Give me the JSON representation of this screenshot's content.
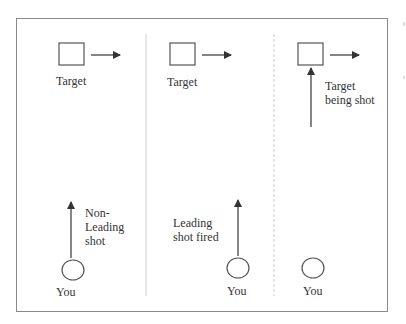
{
  "diagram": {
    "colors": {
      "stroke": "#555555",
      "border": "#8a8a8a",
      "divider": "#cfcfcf",
      "text": "#333333"
    },
    "panels": [
      {
        "id": "panel-1",
        "target_label": "Target",
        "shot_label": "Non-\nLeading\nshot",
        "shooter_label": "You"
      },
      {
        "id": "panel-2",
        "target_label": "Target",
        "shot_label": "Leading\nshot fired",
        "shooter_label": "You"
      },
      {
        "id": "panel-3",
        "target_label": "Target\nbeing shot",
        "shooter_label": "You"
      }
    ]
  }
}
